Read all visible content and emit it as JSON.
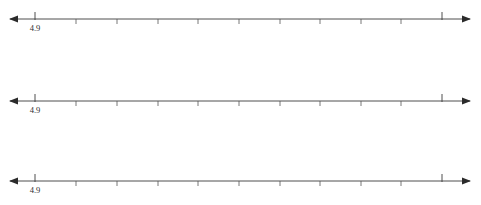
{
  "figure": {
    "type": "number-line-set",
    "background_color": "#ffffff",
    "line_color": "#3a3a3a",
    "label_color": "#2e2e2e",
    "line_count": 3
  },
  "chart_data": {
    "type": "line",
    "title": "",
    "subtitle": "",
    "xlabel": "",
    "ylabel": "",
    "legend": [],
    "grid": false,
    "axis_count": 3,
    "tick_count_per_axis": 11,
    "tick_spacing_px": 40.7,
    "axis_start_px": 10,
    "axis_end_px": 470,
    "tick_positions_px": [
      35,
      76,
      117,
      158,
      198,
      239,
      280,
      320,
      361,
      401,
      442
    ],
    "major_tick_indices": [
      0,
      10
    ],
    "tick_labels": [
      "4.9",
      "",
      "",
      "",
      "",
      "",
      "",
      "",
      "",
      "",
      ""
    ],
    "axes": [
      {
        "name": "number-line-1",
        "y_px": 19,
        "labels": [
          {
            "index": 0,
            "value": "4.9",
            "x_px": 35
          }
        ]
      },
      {
        "name": "number-line-2",
        "y_px": 101,
        "labels": [
          {
            "index": 0,
            "value": "4.9",
            "x_px": 35
          }
        ]
      },
      {
        "name": "number-line-3",
        "y_px": 181,
        "labels": [
          {
            "index": 0,
            "value": "4.9",
            "x_px": 35
          }
        ]
      }
    ]
  }
}
